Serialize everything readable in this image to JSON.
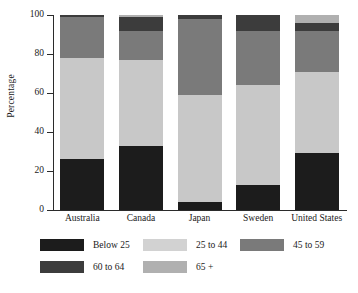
{
  "chart_data": {
    "type": "bar",
    "subtype": "stacked-bar-100",
    "title": "",
    "xlabel": "",
    "ylabel": "Percentage",
    "ylim": [
      0,
      100
    ],
    "yticks": [
      0,
      20,
      40,
      60,
      80,
      100
    ],
    "grid": false,
    "legend_position": "bottom",
    "categories": [
      "Australia",
      "Canada",
      "Japan",
      "Sweden",
      "United States"
    ],
    "series": [
      {
        "name": "Below 25",
        "color": "#1c1c1c",
        "values": [
          26,
          33,
          4,
          13,
          29
        ]
      },
      {
        "name": "25 to 44",
        "color": "#c8c8c8",
        "values": [
          52,
          44,
          55,
          51,
          42
        ]
      },
      {
        "name": "45 to 59",
        "color": "#7a7a7a",
        "values": [
          21,
          15,
          39,
          28,
          21
        ]
      },
      {
        "name": "60 to 64",
        "color": "#3c3c3c",
        "values": [
          1,
          7,
          2,
          8,
          4
        ]
      },
      {
        "name": "65 +",
        "color": "#b0b0b0",
        "values": [
          0,
          1,
          0,
          0,
          4
        ]
      }
    ]
  },
  "axis": {
    "y_title": "Percentage",
    "y_tick_labels": [
      "0",
      "20",
      "40",
      "60",
      "80",
      "100"
    ]
  },
  "legend": {
    "rows": [
      [
        {
          "label": "Below 25",
          "color": "#1c1c1c"
        },
        {
          "label": "25 to 44",
          "color": "#d2d2d2"
        },
        {
          "label": "45 to 59",
          "color": "#7a7a7a"
        }
      ],
      [
        {
          "label": "60 to 64",
          "color": "#3c3c3c"
        },
        {
          "label": "65 +",
          "color": "#b0b0b0"
        }
      ]
    ]
  },
  "caption": ""
}
